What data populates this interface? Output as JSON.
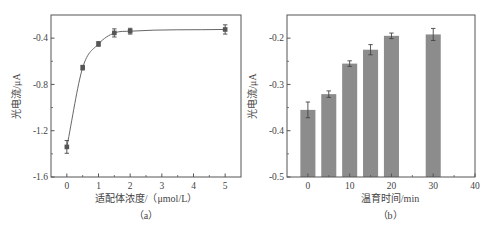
{
  "figure": {
    "background": "#ffffff",
    "axis_color": "#555555",
    "line_color": "#666666",
    "marker_color": "#555555",
    "bar_color": "#8c8c8c",
    "errorbar_color": "#444444"
  },
  "chart_data": [
    {
      "id": "a",
      "type": "line",
      "title": "",
      "caption": "（a）",
      "xlabel": "适配体浓度/（μmol/L）",
      "ylabel": "光电流/μA",
      "xlim": [
        -0.5,
        5.5
      ],
      "ylim": [
        -1.6,
        -0.2
      ],
      "xticks": [
        0,
        1,
        2,
        3,
        4,
        5
      ],
      "xtick_labels": [
        "0",
        "1",
        "2",
        "3",
        "4",
        "5"
      ],
      "xminor": [
        0.5,
        1.5,
        2.5,
        3.5,
        4.5
      ],
      "yticks": [
        -1.6,
        -1.2,
        -0.8,
        -0.4
      ],
      "ytick_labels": [
        "-1.6",
        "-1.2",
        "-0.8",
        "-0.4"
      ],
      "yminor": [
        -1.4,
        -1.0,
        -0.6
      ],
      "grid": false,
      "legend": null,
      "series": [
        {
          "name": "photocurrent",
          "marker": "square",
          "smooth_line": true,
          "x": [
            0,
            0.5,
            1,
            1.5,
            2,
            5
          ],
          "y": [
            -1.34,
            -0.655,
            -0.45,
            -0.355,
            -0.34,
            -0.325
          ],
          "error": [
            0.055,
            0.02,
            0.02,
            0.035,
            0.025,
            0.04
          ]
        }
      ]
    },
    {
      "id": "b",
      "type": "bar",
      "title": "",
      "caption": "（b）",
      "xlabel": "温育时间/min",
      "ylabel": "光电流/μA",
      "xlim": [
        -5,
        40
      ],
      "ylim": [
        -0.5,
        -0.15
      ],
      "xticks": [
        0,
        10,
        20,
        30,
        40
      ],
      "xtick_labels": [
        "0",
        "10",
        "20",
        "30",
        "40"
      ],
      "xminor": [
        5,
        15,
        25,
        35
      ],
      "yticks": [
        -0.5,
        -0.4,
        -0.3,
        -0.2
      ],
      "ytick_labels": [
        "-0.5",
        "-0.4",
        "-0.3",
        "-0.2"
      ],
      "yminor": [
        -0.45,
        -0.35,
        -0.25
      ],
      "grid": false,
      "legend": null,
      "categories": [
        0,
        5,
        10,
        15,
        20,
        30
      ],
      "values": [
        -0.355,
        -0.321,
        -0.255,
        -0.225,
        -0.195,
        -0.192
      ],
      "error": [
        0.017,
        0.007,
        0.006,
        0.011,
        0.006,
        0.013
      ],
      "bar_width": 3.6
    }
  ]
}
